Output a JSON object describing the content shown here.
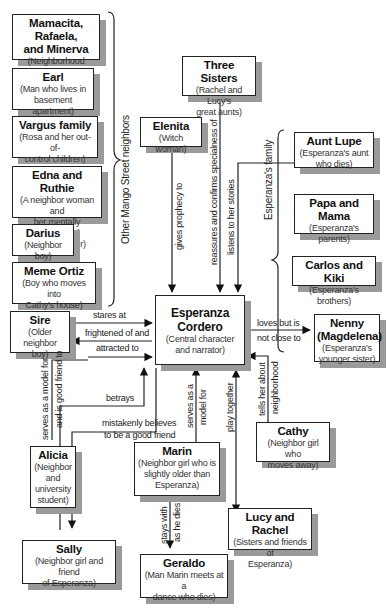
{
  "diagram": {
    "center": {
      "name": "Esperanza Cordero",
      "name_l1": "Esperanza",
      "name_l2": "Cordero",
      "desc_l1": "(Central character",
      "desc_l2": "and narrator)"
    },
    "groups": {
      "neighbors_label": "Other Mango Street neighbors",
      "family_label": "Esperanza's family"
    },
    "nodes": {
      "mamacita": {
        "name_l1": "Mamacita, Rafaela,",
        "name_l2": "and Minerva",
        "desc": "(Neighborhood women)"
      },
      "earl": {
        "name": "Earl",
        "desc_l1": "(Man who lives in",
        "desc_l2": "basement apartment)"
      },
      "vargus": {
        "name": "Vargus family",
        "desc_l1": "(Rosa and her out-of-",
        "desc_l2": "control children)"
      },
      "edna": {
        "name": "Edna and Ruthie",
        "desc_l1": "(A neighbor woman and",
        "desc_l2": "her mentally unbalanced",
        "desc_l3": "adult daughter)"
      },
      "darius": {
        "name": "Darius",
        "desc": "(Neighbor boy)"
      },
      "meme": {
        "name": "Meme Ortiz",
        "desc_l1": "(Boy who moves into",
        "desc_l2": "Cathy's house)"
      },
      "sire": {
        "name": "Sire",
        "desc_l1": "(Older neighbor",
        "desc_l2": "boy)"
      },
      "three_sisters": {
        "name": "Three Sisters",
        "desc_l1": "(Rachel and Lucy's",
        "desc_l2": "great aunts)"
      },
      "elenita": {
        "name": "Elenita",
        "desc": "(Witch woman)"
      },
      "aunt_lupe": {
        "name": "Aunt Lupe",
        "desc_l1": "(Esperanza's aunt",
        "desc_l2": "who dies)"
      },
      "papa_mama": {
        "name": "Papa and Mama",
        "desc_l1": "(Esperanza's",
        "desc_l2": "parents)"
      },
      "carlos_kiki": {
        "name": "Carlos and Kiki",
        "desc": "(Esperanza's brothers)"
      },
      "nenny": {
        "name_l1": "Nenny",
        "name_l2": "(Magdelena)",
        "desc_l1": "(Esperanza's",
        "desc_l2": "younger sister)"
      },
      "alicia": {
        "name": "Alicia",
        "desc_l1": "(Neighbor",
        "desc_l2": "and",
        "desc_l3": "university",
        "desc_l4": "student)"
      },
      "marin": {
        "name": "Marin",
        "desc_l1": "(Neighbor girl who is",
        "desc_l2": "slightly older than",
        "desc_l3": "Esperanza)"
      },
      "cathy": {
        "name": "Cathy",
        "desc_l1": "(Neighbor girl who",
        "desc_l2": "moves away)"
      },
      "lucy_rachel": {
        "name": "Lucy and Rachel",
        "desc_l1": "(Sisters and friends of",
        "desc_l2": "Esperanza)"
      },
      "sally": {
        "name": "Sally",
        "desc_l1": "(Neighbor girl and friend",
        "desc_l2": "of Esperanza)"
      },
      "geraldo": {
        "name": "Geraldo",
        "desc_l1": "(Man Marin meets at a",
        "desc_l2": "dance who dies)"
      }
    },
    "edges": {
      "sire_stares": "stares at",
      "frightened_l1": "frightened of and",
      "frightened_l2": "attracted to",
      "elenita": "gives prophecy to",
      "three_sisters": "reassures and confirms specialness of",
      "aunt_lupe": "listens to her stories",
      "nenny_l1": "loves but is",
      "nenny_l2": "not close to",
      "alicia_l1": "serves as a model for",
      "alicia_l2": "and is good friend to",
      "sally_betrays": "betrays",
      "sally_believes_l1": "mistakenly believes",
      "sally_believes_l2": "to be a good friend",
      "marin_l1": "serves as a",
      "marin_l2": "model for",
      "lucy": "play together",
      "cathy_l1": "tells her about",
      "cathy_l2": "neighborhood",
      "geraldo_l1": "stays with",
      "geraldo_l2": "as he dies"
    }
  }
}
